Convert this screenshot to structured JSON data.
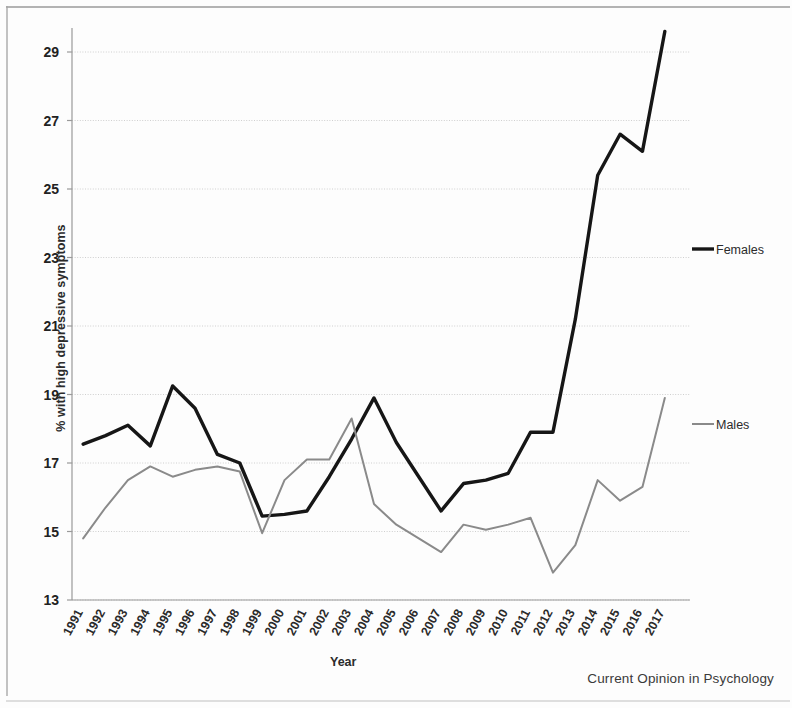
{
  "figure": {
    "y_axis_title": "% with high depressive symptoms",
    "x_axis_title": "Year",
    "journal_footer": "Current Opinion in Psychology"
  },
  "legend": {
    "position": "right",
    "entries": [
      {
        "label": "Females",
        "color": "#161616",
        "line_width": 3.4
      },
      {
        "label": "Males",
        "color": "#8a8a8a",
        "line_width": 2.0
      }
    ]
  },
  "colors": {
    "females_line": "#161616",
    "males_line": "#8a8a8a",
    "gridline": "#cfcfcf",
    "axis": "#9a9a9a",
    "text": "#222222",
    "background": "#fdfdfd"
  },
  "chart_data": {
    "type": "line",
    "title": "",
    "subtitle": "",
    "xlabel": "Year",
    "ylabel": "% with high depressive symptoms",
    "grid": true,
    "legend_position": "right",
    "xlim": [
      1991,
      2017
    ],
    "ylim": [
      13,
      29
    ],
    "ytick_labels": [
      "13",
      "15",
      "17",
      "19",
      "21",
      "23",
      "25",
      "27",
      "29"
    ],
    "yticks": [
      13,
      15,
      17,
      19,
      21,
      23,
      25,
      27,
      29
    ],
    "x": [
      1991,
      1992,
      1993,
      1994,
      1995,
      1996,
      1997,
      1998,
      1999,
      2000,
      2001,
      2002,
      2003,
      2004,
      2005,
      2006,
      2007,
      2008,
      2009,
      2010,
      2011,
      2012,
      2013,
      2014,
      2015,
      2016,
      2017
    ],
    "xtick_labels": [
      "1991",
      "1992",
      "1993",
      "1994",
      "1995",
      "1996",
      "1997",
      "1998",
      "1999",
      "2000",
      "2001",
      "2002",
      "2003",
      "2004",
      "2005",
      "2006",
      "2007",
      "2008",
      "2009",
      "2010",
      "2011",
      "2012",
      "2013",
      "2014",
      "2015",
      "2016",
      "2017"
    ],
    "series": [
      {
        "name": "Females",
        "color": "#161616",
        "values": [
          17.55,
          17.8,
          18.1,
          17.5,
          19.25,
          18.6,
          17.25,
          17.0,
          15.45,
          15.5,
          15.6,
          16.6,
          17.7,
          18.9,
          17.6,
          16.6,
          15.6,
          16.4,
          16.5,
          16.7,
          17.9,
          17.9,
          21.2,
          25.4,
          26.6,
          26.1,
          29.6
        ]
      },
      {
        "name": "Males",
        "color": "#8a8a8a",
        "values": [
          14.8,
          15.7,
          16.5,
          16.9,
          16.6,
          16.8,
          16.9,
          16.75,
          14.95,
          16.5,
          17.1,
          17.1,
          18.3,
          15.8,
          15.2,
          14.8,
          14.4,
          15.2,
          15.05,
          15.2,
          15.4,
          13.8,
          14.6,
          16.5,
          15.9,
          16.3,
          18.9
        ]
      }
    ]
  }
}
